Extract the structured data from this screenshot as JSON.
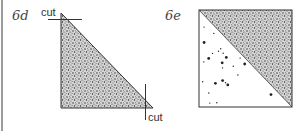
{
  "figures": [
    {
      "id": "6d",
      "label": "6d",
      "shape": "right-triangle",
      "fill": "dense-stipple",
      "cut_labels": [
        "cut",
        "cut"
      ]
    },
    {
      "id": "6e",
      "label": "6e",
      "shape": "square-split-diagonal",
      "upper_fill": "dense-stipple",
      "lower_fill": "sparse-dots"
    }
  ],
  "colors": {
    "ink": "#333333",
    "stipple_dark": "#2a2a2a",
    "stipple_light": "#9a9a9a",
    "margin_line": "#9c9c9c",
    "background": "#ffffff"
  }
}
